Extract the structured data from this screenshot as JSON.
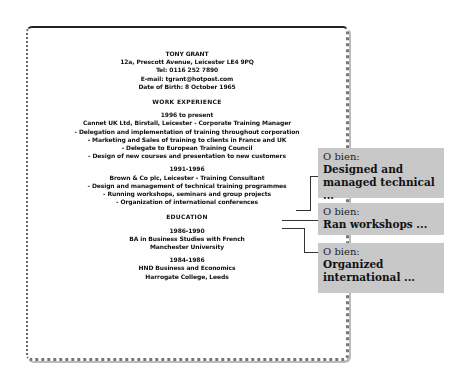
{
  "cv": {
    "name": "TONY GRANT",
    "address": "12a, Prescott Avenue, Leicester LE4 9PQ",
    "tel": "Tel: 0116 252 7890",
    "email": "E-mail: tgrant@hotpost.com",
    "dob": "Date of Birth: 8 October 1965",
    "work_heading": "WORK EXPERIENCE",
    "job1_dates": "1996 to present",
    "job1_title": "Cannet UK Ltd, Birstall, Leicester - Corporate Training Manager",
    "job1_duties": [
      "- Delegation and implementation of training throughout corporation",
      "- Marketing and Sales of training to clients in France and UK",
      "- Delegate to European Training Council",
      "- Design of new courses and presentation to new customers"
    ],
    "job2_dates": "1991-1996",
    "job2_title": "Brown & Co plc, Leicester - Training Consultant",
    "job2_duties": [
      "- Design and management of technical training programmes",
      "- Running workshops, seminars and group projects",
      "- Organization of international conferences"
    ],
    "edu_heading": "EDUCATION",
    "edu1_dates": "1986-1990",
    "edu1_degree": "BA in Business Studies with French",
    "edu1_school": "Manchester University",
    "edu2_dates": "1984-1986",
    "edu2_degree": "HND Business and Economics",
    "edu2_school": "Harrogate College, Leeds"
  },
  "callouts": [
    {
      "prefix": "O bien:",
      "text": "Designed and managed technical ..."
    },
    {
      "prefix": "O bien:",
      "text": "Ran workshops ..."
    },
    {
      "prefix": "O bien:",
      "text": "Organized international ..."
    }
  ]
}
